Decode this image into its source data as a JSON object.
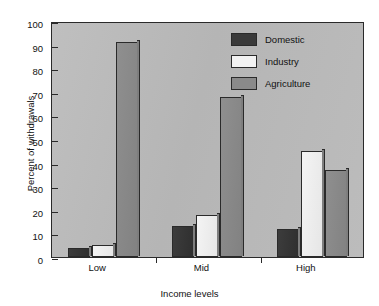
{
  "chart_data": {
    "type": "bar",
    "title": "",
    "xlabel": "Income levels",
    "ylabel": "Percent of withdrawals",
    "categories": [
      "Low",
      "Mid",
      "High"
    ],
    "ylim": [
      0,
      100
    ],
    "yticks": [
      0,
      10,
      20,
      30,
      40,
      50,
      60,
      70,
      80,
      90,
      100
    ],
    "ytick_labels": [
      "0",
      "10",
      "20",
      "30",
      "40",
      "50",
      "60",
      "70",
      "80",
      "90",
      "100"
    ],
    "grid": false,
    "legend_position": "top-right",
    "series": [
      {
        "name": "Domestic",
        "color": "#3a3a3a",
        "values": [
          4,
          13,
          12
        ]
      },
      {
        "name": "Industry",
        "color": "#f2f2f2",
        "values": [
          5,
          18,
          45
        ]
      },
      {
        "name": "Agriculture",
        "color": "#8a8a8a",
        "values": [
          91,
          68,
          37
        ]
      }
    ]
  },
  "legend": {
    "items": [
      {
        "label": "Domestic"
      },
      {
        "label": "Industry"
      },
      {
        "label": "Agriculture"
      }
    ]
  },
  "axes": {
    "y_title": "Percent of withdrawals",
    "x_title": "Income levels"
  }
}
